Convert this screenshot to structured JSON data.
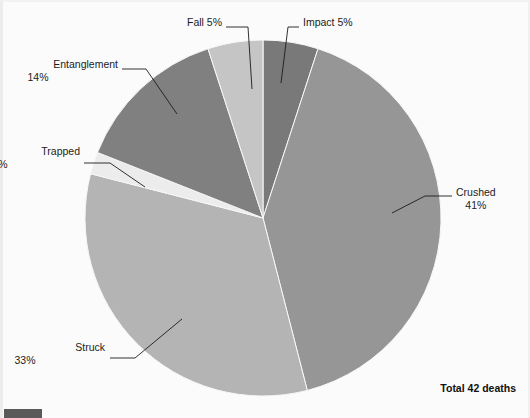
{
  "document": {
    "background_color": "#fbfbfb",
    "corner_marker_color": "#595959"
  },
  "footer": {
    "total_label": "Total 42 deaths"
  },
  "chart_data": {
    "type": "pie",
    "title": "",
    "total_label": "Total 42 deaths",
    "total_value": 42,
    "units": "deaths",
    "legend_position": "callout-labels",
    "start_angle_deg": 0,
    "direction": "clockwise",
    "center": {
      "x": 263,
      "y": 218
    },
    "radius": 178,
    "categories": [
      "Impact",
      "Crushed",
      "Struck",
      "Trapped",
      "Entanglement",
      "Fall"
    ],
    "values": [
      5,
      41,
      33,
      2,
      14,
      5
    ],
    "value_labels": [
      "5%",
      "41%",
      "33%",
      "2%",
      "14%",
      "5%"
    ],
    "colors": [
      "#797979",
      "#969696",
      "#b4b4b4",
      "#ececec",
      "#808080",
      "#c5c5c5"
    ],
    "slices": [
      {
        "name": "Impact",
        "percent": 5,
        "label_line1": "Impact 5%",
        "label_line2": "",
        "color": "#797979",
        "start_deg": 0,
        "end_deg": 18,
        "label_x": 303,
        "label_y": 16,
        "label_align": "left",
        "leader": [
          [
            299,
            27
          ],
          [
            288,
            27
          ],
          [
            281,
            83
          ]
        ]
      },
      {
        "name": "Crushed",
        "percent": 41,
        "label_line1": "Crushed",
        "label_line2": "41%",
        "color": "#969696",
        "start_deg": 18,
        "end_deg": 165.6,
        "label_x": 456,
        "label_y": 186,
        "label_align": "left",
        "leader": [
          [
            452,
            196
          ],
          [
            425,
            196
          ],
          [
            392,
            213
          ]
        ]
      },
      {
        "name": "Struck",
        "percent": 33,
        "label_line1": "Struck",
        "label_line2": "33%",
        "color": "#b4b4b4",
        "start_deg": 165.6,
        "end_deg": 284.4,
        "label_x": 105,
        "label_y": 341,
        "label_align": "right",
        "leader": [
          [
            110,
            358
          ],
          [
            135,
            358
          ],
          [
            182,
            319
          ]
        ]
      },
      {
        "name": "Trapped",
        "percent": 2,
        "label_line1": "Trapped",
        "label_line2": "2%",
        "color": "#ececec",
        "start_deg": 284.4,
        "end_deg": 291.6,
        "label_x": 80,
        "label_y": 145,
        "label_align": "right",
        "leader": [
          [
            84,
            163
          ],
          [
            110,
            163
          ],
          [
            145,
            187
          ]
        ]
      },
      {
        "name": "Entanglement",
        "percent": 14,
        "label_line1": "Entanglement",
        "label_line2": "14%",
        "color": "#808080",
        "start_deg": 291.6,
        "end_deg": 342,
        "label_x": 118,
        "label_y": 58,
        "label_align": "right",
        "leader": [
          [
            122,
            69
          ],
          [
            146,
            69
          ],
          [
            177,
            114
          ]
        ]
      },
      {
        "name": "Fall",
        "percent": 5,
        "label_line1": "Fall 5%",
        "label_line2": "",
        "color": "#c5c5c5",
        "start_deg": 342,
        "end_deg": 360,
        "label_x": 222,
        "label_y": 16,
        "label_align": "right",
        "leader": [
          [
            226,
            27
          ],
          [
            248,
            27
          ],
          [
            252,
            89
          ]
        ]
      }
    ]
  }
}
